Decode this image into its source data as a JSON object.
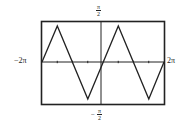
{
  "chart_data": {
    "type": "line",
    "title": "",
    "function_shape": "triangle wave (y = arcsin(sin x))",
    "xlabel": "",
    "ylabel": "",
    "xlim": [
      -6.2832,
      6.2832
    ],
    "ylim": [
      -1.5708,
      1.5708
    ],
    "x_tick_labels": {
      "left": "−2π",
      "right": "2π"
    },
    "y_tick_labels": {
      "top": {
        "num": "π",
        "den": "2"
      },
      "bottom": {
        "sign": "−",
        "num": "π",
        "den": "2"
      }
    },
    "x_ticks_step": "π/2",
    "grid": false,
    "legend": null,
    "series": [
      {
        "name": "y = arcsin(sin x)",
        "x": [
          -6.2832,
          -4.7124,
          -1.5708,
          1.5708,
          4.7124,
          6.2832
        ],
        "y": [
          0,
          1.5708,
          -1.5708,
          1.5708,
          -1.5708,
          0
        ]
      }
    ],
    "colors": {
      "line": "#222222",
      "frame": "#222222",
      "background": "#ffffff"
    }
  }
}
